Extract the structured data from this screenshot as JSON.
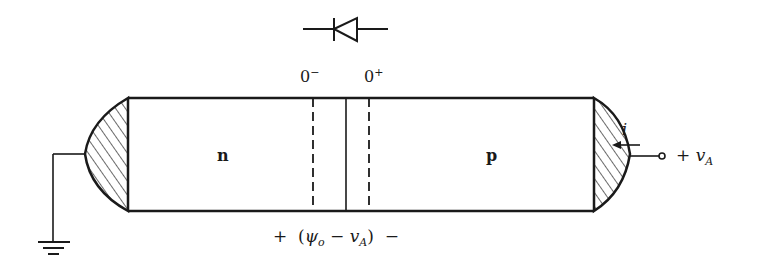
{
  "diagram": {
    "type": "pn-junction-diode",
    "symbol": "diode",
    "boundary_labels": {
      "left": "0",
      "left_sup": "−",
      "right": "0",
      "right_sup": "+"
    },
    "regions": {
      "n_label": "n",
      "p_label": "p"
    },
    "current": {
      "label": "i",
      "direction": "leftward"
    },
    "terminal": {
      "plus": "+",
      "v": "v",
      "sub": "A"
    },
    "junction_voltage": {
      "plus": "+",
      "open": "(",
      "psi": "ψ",
      "psi_sub": "o",
      "minus_mid": "−",
      "v": "v",
      "v_sub": "A",
      "close": ")",
      "minus": "−"
    },
    "ground": "ground",
    "colors": {
      "line": "#1a1a1a",
      "background": "#ffffff"
    }
  }
}
